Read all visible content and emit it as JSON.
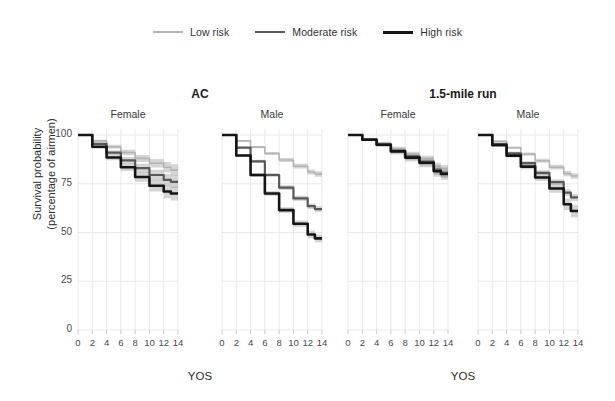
{
  "chart_data": {
    "type": "line",
    "title": "",
    "xlabel": "YOS",
    "ylabel_line1": "Survival probability",
    "ylabel_line2": "(percentage of airmen)",
    "xlim": [
      0,
      14
    ],
    "ylim": [
      0,
      100
    ],
    "xticks": [
      0,
      2,
      4,
      6,
      8,
      10,
      12,
      14
    ],
    "yticks": [
      0,
      25,
      50,
      75,
      100
    ],
    "grid": true,
    "legend_position": "top-center",
    "legend": [
      {
        "name": "Low risk",
        "color": "#b4b4b4",
        "width": 1.6
      },
      {
        "name": "Moderate risk",
        "color": "#585858",
        "width": 2.2
      },
      {
        "name": "High risk",
        "color": "#151515",
        "width": 2.6
      }
    ],
    "groups": [
      {
        "group_label": "AC",
        "panels": [
          {
            "panel_label": "Female",
            "series": [
              {
                "name": "Low risk",
                "x": [
                  0,
                  2,
                  4,
                  6,
                  8,
                  10,
                  12,
                  13,
                  14
                ],
                "y": [
                  100,
                  97.0,
                  94.0,
                  91.0,
                  88.0,
                  85.5,
                  83.5,
                  82.0,
                  82.0
                ],
                "ci_lo": [
                  100,
                  96.4,
                  93.0,
                  89.6,
                  86.2,
                  83.3,
                  80.8,
                  79.0,
                  79.0
                ],
                "ci_hi": [
                  100,
                  97.6,
                  95.0,
                  92.4,
                  89.8,
                  87.7,
                  86.2,
                  85.0,
                  85.0
                ]
              },
              {
                "name": "Moderate risk",
                "x": [
                  0,
                  2,
                  4,
                  6,
                  8,
                  10,
                  12,
                  13,
                  14
                ],
                "y": [
                  100,
                  95.5,
                  91.0,
                  87.0,
                  83.0,
                  79.5,
                  77.0,
                  76.0,
                  76.0
                ],
                "ci_lo": [
                  100,
                  94.8,
                  89.8,
                  85.3,
                  80.8,
                  76.8,
                  74.0,
                  72.8,
                  72.8
                ],
                "ci_hi": [
                  100,
                  96.2,
                  92.2,
                  88.7,
                  85.2,
                  82.2,
                  80.0,
                  79.2,
                  79.2
                ]
              },
              {
                "name": "High risk",
                "x": [
                  0,
                  2,
                  4,
                  6,
                  8,
                  10,
                  12,
                  13,
                  14
                ],
                "y": [
                  100,
                  94.0,
                  88.5,
                  83.5,
                  78.5,
                  74.0,
                  71.0,
                  70.0,
                  70.0
                ],
                "ci_lo": [
                  100,
                  93.0,
                  87.0,
                  81.5,
                  76.0,
                  71.0,
                  67.6,
                  66.4,
                  66.4
                ],
                "ci_hi": [
                  100,
                  95.0,
                  90.0,
                  85.5,
                  81.0,
                  77.0,
                  74.4,
                  73.6,
                  73.6
                ]
              }
            ]
          },
          {
            "panel_label": "Male",
            "series": [
              {
                "name": "Low risk",
                "x": [
                  0,
                  2,
                  4,
                  6,
                  8,
                  10,
                  12,
                  13,
                  14
                ],
                "y": [
                  100,
                  97.0,
                  93.8,
                  90.5,
                  87.2,
                  84.0,
                  81.0,
                  80.0,
                  80.0
                ],
                "ci_lo": [
                  100,
                  96.6,
                  93.2,
                  89.7,
                  86.2,
                  82.8,
                  79.7,
                  78.6,
                  78.6
                ],
                "ci_hi": [
                  100,
                  97.4,
                  94.4,
                  91.3,
                  88.2,
                  85.2,
                  82.3,
                  81.4,
                  81.4
                ]
              },
              {
                "name": "Moderate risk",
                "x": [
                  0,
                  2,
                  4,
                  6,
                  8,
                  10,
                  12,
                  13,
                  14
                ],
                "y": [
                  100,
                  93.5,
                  86.5,
                  79.5,
                  73.0,
                  67.5,
                  63.5,
                  62.0,
                  62.0
                ],
                "ci_lo": [
                  100,
                  93.0,
                  85.7,
                  78.5,
                  71.8,
                  66.2,
                  62.1,
                  60.6,
                  60.6
                ],
                "ci_hi": [
                  100,
                  94.0,
                  87.3,
                  80.5,
                  74.2,
                  68.8,
                  64.9,
                  63.4,
                  63.4
                ]
              },
              {
                "name": "High risk",
                "x": [
                  0,
                  2,
                  4,
                  6,
                  8,
                  10,
                  12,
                  13,
                  14
                ],
                "y": [
                  100,
                  89.5,
                  79.5,
                  70.0,
                  61.5,
                  54.5,
                  49.0,
                  47.0,
                  47.0
                ],
                "ci_lo": [
                  100,
                  88.8,
                  78.5,
                  68.7,
                  60.0,
                  52.8,
                  47.0,
                  45.0,
                  45.0
                ],
                "ci_hi": [
                  100,
                  90.2,
                  80.5,
                  71.3,
                  63.0,
                  56.2,
                  51.0,
                  49.0,
                  49.0
                ]
              }
            ]
          }
        ]
      },
      {
        "group_label": "1.5-mile run",
        "panels": [
          {
            "panel_label": "Female",
            "series": [
              {
                "name": "Low risk",
                "x": [
                  0,
                  2,
                  4,
                  6,
                  8,
                  10,
                  12,
                  13,
                  14
                ],
                "y": [
                  100,
                  98.0,
                  95.5,
                  92.5,
                  89.5,
                  87.0,
                  83.0,
                  81.5,
                  81.5
                ],
                "ci_lo": [
                  100,
                  97.4,
                  94.4,
                  91.0,
                  87.6,
                  84.6,
                  80.2,
                  78.4,
                  78.4
                ],
                "ci_hi": [
                  100,
                  98.6,
                  96.6,
                  94.0,
                  91.4,
                  89.4,
                  85.8,
                  84.6,
                  84.6
                ]
              },
              {
                "name": "Moderate risk",
                "x": [
                  0,
                  2,
                  4,
                  6,
                  8,
                  10,
                  12,
                  13,
                  14
                ],
                "y": [
                  100,
                  97.8,
                  95.2,
                  92.0,
                  89.0,
                  86.4,
                  82.2,
                  80.7,
                  80.7
                ],
                "ci_lo": [
                  100,
                  97.2,
                  94.2,
                  90.6,
                  87.2,
                  84.2,
                  79.6,
                  78.0,
                  78.0
                ],
                "ci_hi": [
                  100,
                  98.4,
                  96.2,
                  93.4,
                  90.8,
                  88.6,
                  84.8,
                  83.4,
                  83.4
                ]
              },
              {
                "name": "High risk",
                "x": [
                  0,
                  2,
                  4,
                  6,
                  8,
                  10,
                  12,
                  13,
                  14
                ],
                "y": [
                  100,
                  97.6,
                  95.0,
                  91.6,
                  88.4,
                  85.8,
                  81.4,
                  80.0,
                  80.0
                ],
                "ci_lo": [
                  100,
                  97.0,
                  93.8,
                  90.0,
                  86.4,
                  83.4,
                  78.6,
                  77.0,
                  77.0
                ],
                "ci_hi": [
                  100,
                  98.2,
                  96.2,
                  93.2,
                  90.4,
                  88.2,
                  84.2,
                  83.0,
                  83.0
                ]
              }
            ]
          },
          {
            "panel_label": "Male",
            "series": [
              {
                "name": "Low risk",
                "x": [
                  0,
                  2,
                  4,
                  6,
                  8,
                  10,
                  12,
                  13,
                  14
                ],
                "y": [
                  100,
                  96.8,
                  93.5,
                  90.2,
                  86.8,
                  83.5,
                  80.2,
                  79.0,
                  79.0
                ],
                "ci_lo": [
                  100,
                  96.4,
                  92.9,
                  89.4,
                  85.8,
                  82.3,
                  78.9,
                  77.6,
                  77.6
                ],
                "ci_hi": [
                  100,
                  97.2,
                  94.1,
                  91.0,
                  87.8,
                  84.7,
                  81.5,
                  80.4,
                  80.4
                ]
              },
              {
                "name": "Moderate risk",
                "x": [
                  0,
                  2,
                  4,
                  6,
                  8,
                  10,
                  12,
                  13,
                  14
                ],
                "y": [
                  100,
                  95.4,
                  90.6,
                  85.6,
                  80.6,
                  75.8,
                  70.4,
                  68.0,
                  68.0
                ],
                "ci_lo": [
                  100,
                  94.9,
                  89.8,
                  84.6,
                  79.3,
                  74.3,
                  68.6,
                  66.2,
                  66.2
                ],
                "ci_hi": [
                  100,
                  95.9,
                  91.4,
                  86.6,
                  81.9,
                  77.3,
                  72.2,
                  69.8,
                  69.8
                ]
              },
              {
                "name": "High risk",
                "x": [
                  0,
                  2,
                  4,
                  6,
                  8,
                  10,
                  12,
                  13,
                  14
                ],
                "y": [
                  100,
                  94.8,
                  89.4,
                  83.8,
                  78.2,
                  72.6,
                  64.5,
                  61.0,
                  61.0
                ],
                "ci_lo": [
                  100,
                  94.2,
                  88.4,
                  82.4,
                  76.4,
                  70.4,
                  61.6,
                  57.8,
                  57.8
                ],
                "ci_hi": [
                  100,
                  95.4,
                  90.4,
                  85.2,
                  80.0,
                  74.8,
                  67.4,
                  64.2,
                  64.2
                ]
              }
            ]
          }
        ]
      }
    ]
  }
}
